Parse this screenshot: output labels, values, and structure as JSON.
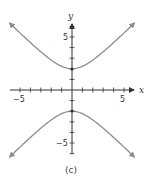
{
  "chart_data": {
    "type": "line",
    "title": "",
    "caption": "(c)",
    "xlabel": "x",
    "ylabel": "y",
    "xlim": [
      -5.5,
      6
    ],
    "ylim": [
      -6.5,
      6.5
    ],
    "x_tick_labels": [
      "-5",
      "5"
    ],
    "y_tick_labels": [
      "5",
      "-5"
    ],
    "tick_spacing": 1,
    "grid": false,
    "legend": null,
    "equation": "y^2/4 - x^2/4 = 1",
    "vertices": [
      [
        0,
        2
      ],
      [
        0,
        -2
      ]
    ],
    "series": [
      {
        "name": "upper branch",
        "x": [
          -5.5,
          -4,
          -3,
          -2,
          -1,
          0,
          1,
          2,
          3,
          4,
          5.5
        ],
        "y": [
          5.85,
          4.47,
          3.61,
          2.83,
          2.24,
          2.0,
          2.24,
          2.83,
          3.61,
          4.47,
          5.85
        ]
      },
      {
        "name": "lower branch",
        "x": [
          -5.5,
          -4,
          -3,
          -2,
          -1,
          0,
          1,
          2,
          3,
          4,
          5.5
        ],
        "y": [
          -5.85,
          -4.47,
          -3.61,
          -2.83,
          -2.24,
          -2.0,
          -2.24,
          -2.83,
          -3.61,
          -4.47,
          -5.85
        ]
      }
    ],
    "colors": {
      "curve": "#8c8c8c",
      "axis": "#333333"
    }
  },
  "labels": {
    "x_axis": "x",
    "y_axis": "y",
    "x_neg5": "−5",
    "x_pos5": "5",
    "y_pos5": "5",
    "y_neg5": "−5",
    "caption": "(c)"
  }
}
